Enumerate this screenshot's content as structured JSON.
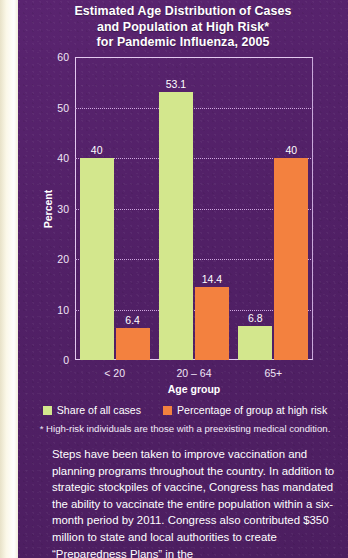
{
  "chart_data": {
    "type": "bar",
    "title": "Estimated Age Distribution of Cases and Population at High Risk* for Pandemic Influenza, 2005",
    "title_lines": [
      "Estimated Age Distribution of Cases",
      "and Population at High Risk*",
      "for Pandemic Influenza, 2005"
    ],
    "categories": [
      "< 20",
      "20 – 64",
      "65+"
    ],
    "series": [
      {
        "name": "Share of all cases",
        "color": "#d3e78d",
        "values": [
          40,
          53.1,
          6.8
        ],
        "labels": [
          "40",
          "53.1",
          "6.8"
        ]
      },
      {
        "name": "Percentage of group at high risk",
        "color": "#f3813f",
        "values": [
          6.4,
          14.4,
          40
        ],
        "labels": [
          "6.4",
          "14.4",
          "40"
        ]
      }
    ],
    "xlabel": "Age group",
    "ylabel": "Percent",
    "ylim": [
      0,
      60
    ],
    "yticks": [
      "60",
      "50",
      "40",
      "30",
      "20",
      "10",
      "0"
    ],
    "ytick_values": [
      60,
      50,
      40,
      30,
      20,
      10,
      0
    ],
    "grid": true,
    "legend_position": "bottom",
    "footnote": "* High-risk individuals are those with a preexisting medical condition."
  },
  "legend": [
    {
      "label": "Share of all cases",
      "color": "#d3e78d"
    },
    {
      "label": "Percentage of group at high risk",
      "color": "#f3813f"
    }
  ],
  "body": {
    "paragraph": "Steps have been taken to improve vaccination and planning programs throughout  the country.  In addition to strategic stockpiles of vaccine, Congress has mandated the ability to vaccinate the entire population within a six-month period by 2011. Congress also contributed $350 million to state and local authorities to create “Preparedness Plans” in the"
  },
  "colors": {
    "panel_background": "#55206b",
    "page_edge": "#fdfbef",
    "cases": "#d3e78d",
    "high_risk": "#f3813f",
    "axis": "#e3c9ef",
    "gridline": "#cfa6e0",
    "text": "#ffffff"
  }
}
